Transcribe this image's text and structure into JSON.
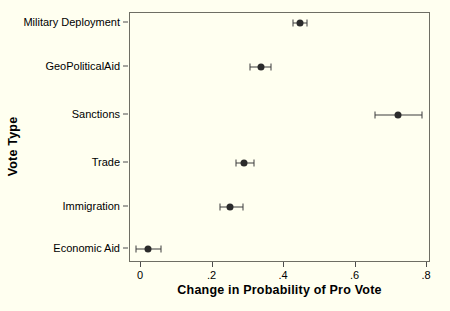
{
  "chart_data": {
    "type": "scatter",
    "title": "",
    "subtitle": "",
    "xlabel": "Change in Probability of Pro Vote",
    "ylabel": "Vote Type",
    "orientation": "horizontal",
    "grid": false,
    "legend": "none",
    "xlim": [
      -0.03,
      0.81
    ],
    "x_ticks": [
      "0",
      ".2",
      ".4",
      ".6",
      ".8"
    ],
    "x_tick_values": [
      0,
      0.2,
      0.4,
      0.6,
      0.8
    ],
    "categories": [
      "Military Deployment",
      "GeoPoliticalAid",
      "Sanctions",
      "Trade",
      "Immigration",
      "Economic Aid"
    ],
    "values": [
      0.445,
      0.335,
      0.72,
      0.288,
      0.25,
      0.02
    ],
    "ci_low": [
      0.425,
      0.305,
      0.655,
      0.265,
      0.222,
      -0.015
    ],
    "ci_high": [
      0.465,
      0.365,
      0.785,
      0.315,
      0.285,
      0.055
    ],
    "points": [
      {
        "category": "Military Deployment",
        "value": 0.445,
        "ci_low": 0.425,
        "ci_high": 0.465
      },
      {
        "category": "GeoPoliticalAid",
        "value": 0.335,
        "ci_low": 0.305,
        "ci_high": 0.365
      },
      {
        "category": "Sanctions",
        "value": 0.72,
        "ci_low": 0.655,
        "ci_high": 0.785
      },
      {
        "category": "Trade",
        "value": 0.288,
        "ci_low": 0.265,
        "ci_high": 0.315
      },
      {
        "category": "Immigration",
        "value": 0.25,
        "ci_low": 0.222,
        "ci_high": 0.285
      },
      {
        "category": "Economic Aid",
        "value": 0.02,
        "ci_low": -0.015,
        "ci_high": 0.055
      }
    ],
    "marker_color": "#2b2b2b",
    "line_color": "#3d3d3d",
    "frame_color": "#6e6e64",
    "background_color": "#fffff0"
  }
}
